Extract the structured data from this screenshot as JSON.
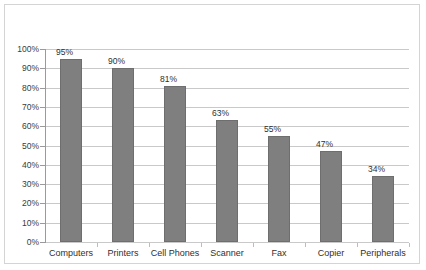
{
  "chart_data": {
    "type": "bar",
    "title": "",
    "subtitle": "",
    "xlabel": "",
    "ylabel": "",
    "categories": [
      "Computers",
      "Printers",
      "Cell Phones",
      "Scanner",
      "Fax",
      "Copier",
      "Peripherals"
    ],
    "values": [
      95,
      90,
      81,
      63,
      55,
      47,
      34
    ],
    "data_labels": [
      "95%",
      "90%",
      "81%",
      "63%",
      "55%",
      "47%",
      "34%"
    ],
    "ylim": [
      0,
      100
    ],
    "ytick_step": 10,
    "ytick_labels": [
      "100%",
      "90%",
      "80%",
      "70%",
      "60%",
      "50%",
      "40%",
      "30%",
      "20%",
      "10%",
      "0%"
    ],
    "ytick_values": [
      100,
      90,
      80,
      70,
      60,
      50,
      40,
      30,
      20,
      10,
      0
    ],
    "grid": true,
    "grid_axis": "y",
    "legend": false,
    "legend_position": "none",
    "series": [
      {
        "name": "",
        "values": [
          95,
          90,
          81,
          63,
          55,
          47,
          34
        ]
      }
    ],
    "colors": {
      "bar_fill": "#7f7f7f",
      "bar_border": "#6e6e6e",
      "gridline": "#c9c9c9",
      "axis": "#9a9a9a",
      "text": "#2f2f2f",
      "frame": "#d4d4d4",
      "background": "#ffffff"
    }
  }
}
